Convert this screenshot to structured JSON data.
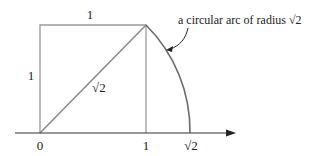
{
  "labels": {
    "top_side": "1",
    "left_side": "1",
    "diagonal": "√2",
    "origin": "0",
    "tick_one": "1",
    "tick_sqrt2": "√2",
    "annotation": "a circular arc of radius √2"
  },
  "colors": {
    "line": "#8a8a8a",
    "axis": "#333333",
    "text": "#222222"
  }
}
